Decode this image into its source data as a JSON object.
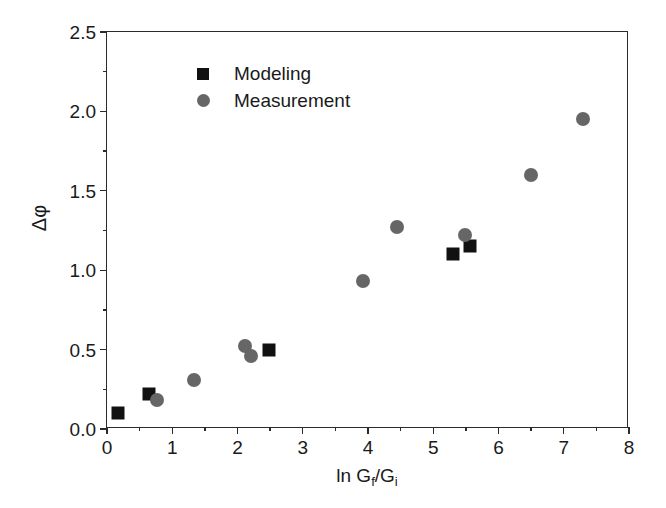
{
  "chart_data": {
    "type": "scatter",
    "title": "",
    "xlabel": "ln Gf/Gi",
    "xlabel_parts": {
      "prefix": "ln G",
      "sub1": "f",
      "middle": "/G",
      "sub2": "i"
    },
    "ylabel": "Δφ",
    "xlim": [
      0,
      8
    ],
    "ylim": [
      0.0,
      2.5
    ],
    "xticks": [
      0,
      1,
      2,
      3,
      4,
      5,
      6,
      7,
      8
    ],
    "xtick_labels": [
      "0",
      "1",
      "2",
      "3",
      "4",
      "5",
      "6",
      "7",
      "8"
    ],
    "x_minor_step": 0.5,
    "yticks": [
      0.0,
      0.5,
      1.0,
      1.5,
      2.0,
      2.5
    ],
    "ytick_labels": [
      "0.0",
      "0.5",
      "1.0",
      "1.5",
      "2.0",
      "2.5"
    ],
    "y_minor_step": 0.25,
    "grid": false,
    "legend_position": "upper-left-inside",
    "series": [
      {
        "name": "Modeling",
        "marker": "square",
        "color": "#111111",
        "points": [
          {
            "x": 0.17,
            "y": 0.1
          },
          {
            "x": 0.64,
            "y": 0.22
          },
          {
            "x": 2.48,
            "y": 0.5
          },
          {
            "x": 5.3,
            "y": 1.1
          },
          {
            "x": 5.57,
            "y": 1.15
          }
        ]
      },
      {
        "name": "Measurement",
        "marker": "circle",
        "color": "#666666",
        "points": [
          {
            "x": 0.77,
            "y": 0.18
          },
          {
            "x": 1.33,
            "y": 0.31
          },
          {
            "x": 2.11,
            "y": 0.52
          },
          {
            "x": 2.21,
            "y": 0.46
          },
          {
            "x": 3.92,
            "y": 0.93
          },
          {
            "x": 4.45,
            "y": 1.27
          },
          {
            "x": 5.49,
            "y": 1.22
          },
          {
            "x": 6.5,
            "y": 1.6
          },
          {
            "x": 7.29,
            "y": 1.95
          }
        ]
      }
    ]
  },
  "legend": {
    "entries": [
      {
        "label": "Modeling",
        "marker": "square"
      },
      {
        "label": "Measurement",
        "marker": "circle"
      }
    ]
  },
  "colors": {
    "modeling": "#111111",
    "measurement": "#666666",
    "axis": "#2b2b2b",
    "background": "#ffffff"
  }
}
